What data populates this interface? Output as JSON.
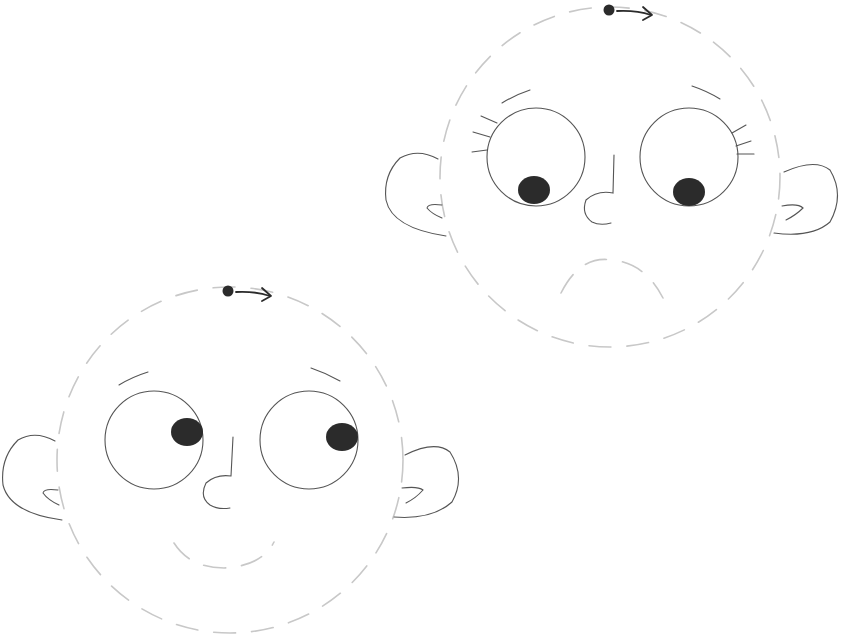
{
  "title": "Two cartoon faces with dashed head outlines and rotation indicators",
  "colors": {
    "background": "#ffffff",
    "outline_dashed": "#c8c8c8",
    "line": "#555555",
    "pupil": "#2b2b2b"
  },
  "faces": [
    {
      "id": "face-sad",
      "expression": "sad, looking down, with eyelashes",
      "head": {
        "cx": 610,
        "cy": 177,
        "r": 170
      },
      "rotation_handle": {
        "dot": [
          609,
          10
        ],
        "arrow_end": [
          652,
          15
        ]
      },
      "eyes": [
        {
          "cx": 536,
          "cy": 157,
          "r": 49,
          "pupil": {
            "cx": 534,
            "cy": 190,
            "rx": 16,
            "ry": 14
          }
        },
        {
          "cx": 689,
          "cy": 157,
          "r": 49,
          "pupil": {
            "cx": 689,
            "cy": 192,
            "rx": 16,
            "ry": 14
          }
        }
      ],
      "mouth": "frown"
    },
    {
      "id": "face-happy",
      "expression": "smiling, looking right",
      "head": {
        "cx": 230,
        "cy": 460,
        "r": 173
      },
      "rotation_handle": {
        "dot": [
          228,
          291
        ],
        "arrow_end": [
          271,
          296
        ]
      },
      "eyes": [
        {
          "cx": 154,
          "cy": 440,
          "r": 49,
          "pupil": {
            "cx": 187,
            "cy": 432,
            "rx": 16,
            "ry": 14
          }
        },
        {
          "cx": 309,
          "cy": 440,
          "r": 49,
          "pupil": {
            "cx": 342,
            "cy": 437,
            "rx": 16,
            "ry": 14
          }
        }
      ],
      "mouth": "smile"
    }
  ]
}
